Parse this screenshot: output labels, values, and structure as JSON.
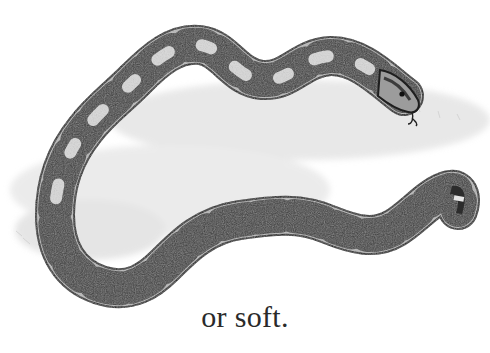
{
  "illustration": {
    "subject": "snake (boa) on grass",
    "style": "pencil drawing, grayscale",
    "colors": {
      "dark_saddle": "#3a3a3a",
      "light_body": "#bdbdbd",
      "outline": "#1e1e1e",
      "grass": "#d4d4d4"
    }
  },
  "caption": {
    "text": "or soft."
  }
}
